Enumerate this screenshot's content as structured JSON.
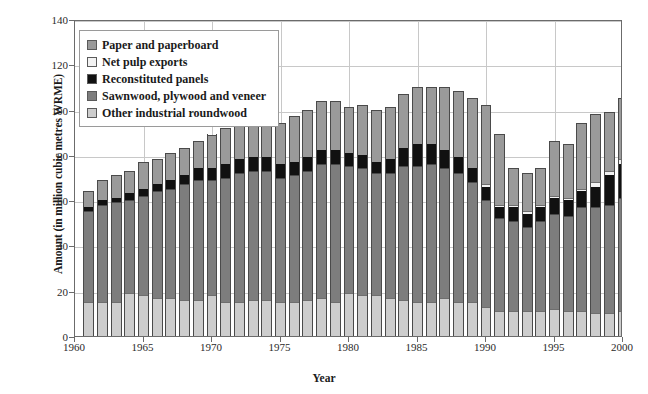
{
  "chart_data": {
    "type": "bar",
    "stacked": true,
    "title": "",
    "xlabel": "Year",
    "ylabel": "Amount (in million cubic metres WRME)",
    "ylim": [
      0,
      140
    ],
    "ytick_values": [
      0,
      20,
      40,
      60,
      80,
      100,
      120,
      140
    ],
    "ytick_labels": [
      "0",
      "20",
      "40",
      "60",
      "80",
      "100",
      "120",
      "140"
    ],
    "xlim": [
      1960,
      2000
    ],
    "xtick_values": [
      1960,
      1965,
      1970,
      1975,
      1980,
      1985,
      1990,
      1995,
      2000
    ],
    "xtick_labels": [
      "1960",
      "1965",
      "1970",
      "1975",
      "1980",
      "1985",
      "1990",
      "1995",
      "2000"
    ],
    "grid": "horizontal-and-vertical",
    "legend_position": "upper-left-inside",
    "legend_entries": [
      "Paper and paperboard",
      "Net pulp exports",
      "Reconstituted panels",
      "Sawnwood, plywood and veneer",
      "Other industrial roundwood"
    ],
    "colors": {
      "paper": "#9a9a9a",
      "pulp": "#f2f2f2",
      "recon": "#111111",
      "sawn": "#7d7d7d",
      "other": "#cdcdcd",
      "axis": "#6b6b6b",
      "grid": "#c8c8c8"
    },
    "categories": [
      1961,
      1962,
      1963,
      1964,
      1965,
      1966,
      1967,
      1968,
      1969,
      1970,
      1971,
      1972,
      1973,
      1974,
      1975,
      1976,
      1977,
      1978,
      1979,
      1980,
      1981,
      1982,
      1983,
      1984,
      1985,
      1986,
      1987,
      1988,
      1989,
      1990,
      1991,
      1992,
      1993,
      1994,
      1995,
      1996,
      1997,
      1998,
      1999,
      2000
    ],
    "stack_order_bottom_to_top": [
      "other",
      "sawn",
      "recon",
      "pulp",
      "paper"
    ],
    "series": [
      {
        "name": "Other industrial roundwood",
        "key": "other",
        "values": [
          15,
          15,
          15,
          19,
          18,
          17,
          17,
          16,
          16,
          18,
          15,
          15,
          16,
          16,
          15,
          15,
          16,
          17,
          15,
          19,
          18,
          18,
          17,
          16,
          15,
          15,
          17,
          15,
          15,
          13,
          11,
          11,
          11,
          11,
          12,
          11,
          11,
          10,
          10,
          11
        ]
      },
      {
        "name": "Sawnwood, plywood and veneer",
        "key": "sawn",
        "values": [
          40,
          43,
          44,
          41,
          44,
          47,
          48,
          51,
          53,
          51,
          55,
          57,
          57,
          57,
          55,
          56,
          57,
          59,
          61,
          56,
          56,
          54,
          55,
          59,
          60,
          61,
          57,
          57,
          53,
          47,
          41,
          40,
          37,
          40,
          42,
          42,
          46,
          47,
          48,
          50
        ]
      },
      {
        "name": "Reconstituted panels",
        "key": "recon",
        "values": [
          2,
          2,
          2,
          3,
          3,
          3,
          4,
          4,
          5,
          5,
          6,
          6,
          6,
          6,
          6,
          6,
          6,
          6,
          6,
          6,
          6,
          5,
          6,
          8,
          10,
          9,
          8,
          7,
          6,
          6,
          5,
          6,
          6,
          6,
          7,
          7,
          7,
          9,
          13,
          15
        ]
      },
      {
        "name": "Net pulp exports",
        "key": "pulp",
        "values": [
          0,
          0,
          0,
          0,
          0,
          0,
          0,
          0,
          0,
          0,
          0,
          0,
          0,
          0,
          0,
          0,
          0,
          0,
          0,
          0,
          0,
          0,
          0,
          0,
          0,
          0,
          0,
          0,
          0,
          1,
          1,
          1,
          1,
          1,
          1,
          1,
          1,
          2,
          2,
          2
        ]
      },
      {
        "name": "Paper and paperboard",
        "key": "paper",
        "values": [
          7,
          9,
          10,
          10,
          12,
          11,
          12,
          12,
          12,
          15,
          16,
          16,
          17,
          20,
          18,
          20,
          21,
          22,
          22,
          20,
          22,
          23,
          23,
          24,
          25,
          25,
          28,
          29,
          31,
          35,
          31,
          16,
          17,
          16,
          24,
          24,
          29,
          30,
          26,
          27
        ]
      }
    ],
    "totals": [
      64,
      69,
      71,
      73,
      77,
      78,
      81,
      83,
      86,
      89,
      92,
      94,
      96,
      99,
      94,
      97,
      100,
      104,
      104,
      101,
      102,
      100,
      101,
      107,
      110,
      110,
      110,
      108,
      105,
      102,
      89,
      74,
      72,
      74,
      86,
      85,
      94,
      98,
      99,
      105
    ]
  }
}
